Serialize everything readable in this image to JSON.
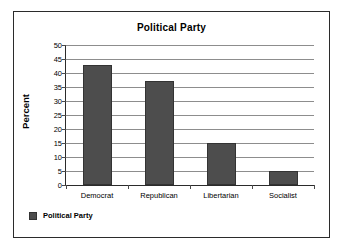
{
  "chart_data": {
    "type": "bar",
    "title": "Political Party",
    "xlabel": "",
    "ylabel": "Percent",
    "categories": [
      "Democrat",
      "Republican",
      "Libertarian",
      "Socialist"
    ],
    "values": [
      43,
      37,
      15,
      5
    ],
    "series": [
      {
        "name": "Political Party",
        "values": [
          43,
          37,
          15,
          5
        ]
      }
    ],
    "ylim": [
      0,
      50
    ],
    "ytick_values": [
      0,
      5,
      10,
      15,
      20,
      25,
      30,
      35,
      40,
      45,
      50
    ],
    "ytick_labels": [
      "0",
      "5",
      "10",
      "15",
      "20",
      "25",
      "30",
      "35",
      "40",
      "45",
      "50"
    ],
    "grid": true,
    "legend_position": "bottom-left",
    "legend_entries": [
      "Political Party"
    ],
    "bar_color": "#4d4d4d",
    "gridline_color": "#8d8d8d",
    "axis_color": "#2b2b2b",
    "text_color": "#000000"
  }
}
